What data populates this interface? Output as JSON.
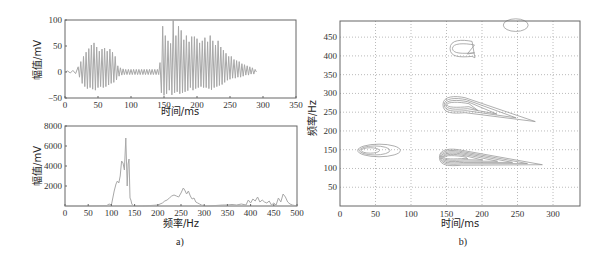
{
  "chart_data": [
    {
      "id": "a-top",
      "type": "line",
      "title": "",
      "xlabel": "时间/ms",
      "ylabel": "幅值/mV",
      "xlim": [
        0,
        350
      ],
      "ylim": [
        -50,
        100
      ],
      "xticks": [
        0,
        50,
        100,
        150,
        200,
        250,
        300,
        350
      ],
      "yticks": [
        -50,
        0,
        50,
        100
      ],
      "grid": false,
      "series": [
        {
          "name": "signal",
          "color": "#a8a8a8",
          "x": [
            0,
            4,
            8,
            12,
            16,
            20,
            22,
            24,
            26,
            28,
            30,
            32,
            34,
            36,
            38,
            40,
            42,
            44,
            46,
            48,
            50,
            52,
            54,
            56,
            58,
            60,
            62,
            64,
            66,
            68,
            70,
            72,
            74,
            76,
            78,
            80,
            82,
            84,
            86,
            88,
            90,
            92,
            94,
            96,
            98,
            100,
            102,
            104,
            106,
            108,
            110,
            112,
            114,
            116,
            118,
            120,
            122,
            124,
            126,
            128,
            130,
            132,
            134,
            136,
            138,
            140,
            142,
            144,
            146,
            148,
            150,
            152,
            154,
            156,
            158,
            160,
            162,
            164,
            166,
            168,
            170,
            172,
            174,
            176,
            178,
            180,
            182,
            184,
            186,
            188,
            190,
            192,
            194,
            196,
            198,
            200,
            202,
            204,
            206,
            208,
            210,
            212,
            214,
            216,
            218,
            220,
            222,
            224,
            226,
            228,
            230,
            232,
            234,
            236,
            238,
            240,
            242,
            244,
            246,
            248,
            250,
            252,
            254,
            256,
            258,
            260,
            262,
            264,
            266,
            268,
            270,
            272,
            274,
            276,
            278,
            280,
            282,
            284,
            286,
            288,
            290,
            292,
            294,
            296,
            298,
            300,
            302,
            304,
            306,
            308,
            310,
            312,
            314,
            316,
            318,
            320,
            322,
            324,
            326,
            328,
            330,
            332,
            335
          ],
          "y": [
            0,
            2,
            -2,
            3,
            -3,
            10,
            -10,
            20,
            -22,
            30,
            -28,
            38,
            -32,
            45,
            -30,
            52,
            -33,
            56,
            -35,
            48,
            -30,
            40,
            -28,
            44,
            -30,
            46,
            -28,
            40,
            -25,
            44,
            -22,
            38,
            -20,
            30,
            -15,
            12,
            -8,
            8,
            -6,
            6,
            -5,
            5,
            -5,
            5,
            -5,
            5,
            -5,
            5,
            -5,
            5,
            -5,
            5,
            -5,
            5,
            -5,
            5,
            -5,
            5,
            -5,
            5,
            -5,
            5,
            -5,
            5,
            -5,
            5,
            -5,
            18,
            -40,
            88,
            -45,
            70,
            -42,
            60,
            -35,
            55,
            -44,
            100,
            -40,
            70,
            -38,
            88,
            -42,
            80,
            -40,
            62,
            -38,
            70,
            -36,
            58,
            -30,
            68,
            -35,
            68,
            -32,
            64,
            -30,
            56,
            -28,
            60,
            -30,
            66,
            -30,
            58,
            -32,
            70,
            -34,
            60,
            -30,
            52,
            -28,
            60,
            -26,
            48,
            -24,
            42,
            -20,
            36,
            -16,
            30,
            -14,
            30,
            -12,
            24,
            -12,
            22,
            -10,
            20,
            -10,
            16,
            -8,
            14,
            -6,
            12,
            -6,
            10,
            -4,
            8,
            -4,
            5,
            0
          ]
        }
      ]
    },
    {
      "id": "a-bottom",
      "type": "line",
      "title": "",
      "xlabel": "频率/Hz",
      "ylabel": "幅值/mV",
      "xlim": [
        0,
        500
      ],
      "ylim": [
        0,
        8000
      ],
      "xticks": [
        0,
        50,
        100,
        150,
        200,
        250,
        300,
        350,
        400,
        450,
        500
      ],
      "yticks": [
        2000,
        4000,
        6000,
        8000
      ],
      "grid": false,
      "series": [
        {
          "name": "spectrum",
          "color": "#a8a8a8",
          "x": [
            0,
            50,
            90,
            95,
            100,
            103,
            106,
            110,
            113,
            116,
            119,
            122,
            125,
            128,
            131,
            134,
            136,
            138,
            140,
            142,
            144,
            146,
            148,
            150,
            152,
            154,
            156,
            160,
            170,
            200,
            210,
            215,
            220,
            225,
            230,
            235,
            240,
            245,
            250,
            255,
            258,
            262,
            266,
            270,
            274,
            278,
            282,
            286,
            290,
            294,
            298,
            302,
            310,
            340,
            350,
            360,
            370,
            380,
            390,
            395,
            400,
            405,
            410,
            415,
            420,
            425,
            430,
            435,
            440,
            445,
            450,
            455,
            460,
            465,
            470,
            475,
            480,
            485,
            490,
            500
          ],
          "y": [
            0,
            0,
            50,
            200,
            100,
            800,
            1500,
            2200,
            2500,
            2300,
            3000,
            4500,
            4300,
            3600,
            6800,
            2000,
            4200,
            4700,
            800,
            600,
            200,
            100,
            0,
            0,
            0,
            0,
            0,
            0,
            0,
            100,
            300,
            500,
            600,
            800,
            1000,
            1100,
            1000,
            900,
            1300,
            1800,
            1600,
            1200,
            1500,
            1000,
            700,
            800,
            400,
            300,
            200,
            100,
            50,
            0,
            0,
            100,
            100,
            150,
            100,
            200,
            100,
            600,
            300,
            700,
            500,
            900,
            400,
            600,
            400,
            300,
            500,
            100,
            300,
            100,
            800,
            400,
            1200,
            900,
            400,
            200,
            100,
            0
          ],
          "peak": {
            "x": 136,
            "y": 6800
          }
        }
      ]
    },
    {
      "id": "b",
      "type": "contour",
      "title": "",
      "xlabel": "时间/ms",
      "ylabel": "频率/Hz",
      "xlim": [
        0,
        338
      ],
      "ylim": [
        0,
        493
      ],
      "xticks": [
        0,
        50,
        100,
        150,
        200,
        250,
        300
      ],
      "yticks": [
        0,
        50,
        100,
        150,
        200,
        250,
        300,
        350,
        400,
        450
      ],
      "grid": true,
      "grid_style": "dotted",
      "contour_regions": [
        {
          "center_ms": 50,
          "center_hz": 148,
          "levels": 3,
          "extent_ms": [
            25,
            85
          ]
        },
        {
          "center_ms": 170,
          "center_hz": 130,
          "levels": 6,
          "extent_ms": [
            140,
            285
          ],
          "tail_hz": 110
        },
        {
          "center_ms": 175,
          "center_hz": 270,
          "levels": 4,
          "extent_ms": [
            145,
            275
          ],
          "tail_hz": 225
        },
        {
          "center_ms": 165,
          "center_hz": 420,
          "levels": 2,
          "extent_ms": [
            155,
            190
          ],
          "tail_hz": 395
        },
        {
          "center_ms": 245,
          "center_hz": 482,
          "levels": 1,
          "extent_ms": [
            230,
            265
          ]
        }
      ]
    }
  ],
  "captions": {
    "a": "a)",
    "b": "b)"
  },
  "labels": {
    "top_xlabel": "时间/ms",
    "top_ylabel": "幅值/mV",
    "bottom_xlabel": "频率/Hz",
    "bottom_ylabel": "幅值/mV",
    "b_xlabel": "时间/ms",
    "b_ylabel": "频率/Hz"
  }
}
